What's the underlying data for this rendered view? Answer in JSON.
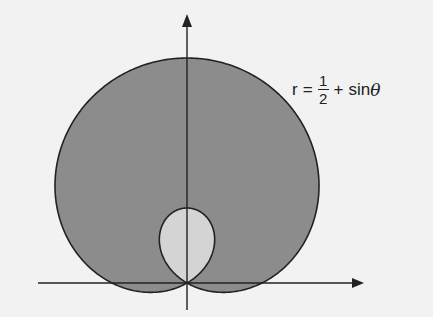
{
  "diagram": {
    "equation": {
      "lhs": "r",
      "eq": "=",
      "numerator": "1",
      "denominator": "2",
      "plus": "+",
      "func": "sin",
      "var": "θ"
    },
    "curve": {
      "type": "polar",
      "a": 0.5,
      "b": 1,
      "trig": "sin",
      "origin_px": [
        187,
        283
      ],
      "scale_px_per_unit": 150
    },
    "colors": {
      "background": "#f2f2f2",
      "outer_fill": "#8c8c8c",
      "inner_fill": "#d4d4d4",
      "stroke": "#222222",
      "axes": "#222222"
    },
    "axes": {
      "x_axis": {
        "from": [
          38,
          283
        ],
        "to": [
          362,
          283
        ],
        "arrow": "right"
      },
      "y_axis": {
        "from": [
          187,
          310
        ],
        "to": [
          187,
          15
        ],
        "arrow": "up"
      }
    }
  }
}
